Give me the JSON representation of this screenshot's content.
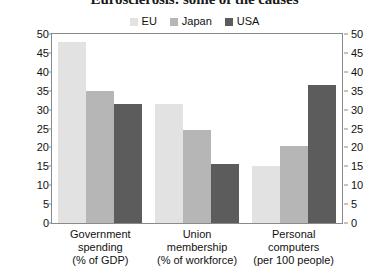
{
  "chart_data": {
    "type": "bar",
    "title": "Eurosclerosis: some of the causes",
    "xlabel": "",
    "ylabel": "",
    "ylim": [
      0,
      50
    ],
    "yticks": [
      0,
      5,
      10,
      15,
      20,
      25,
      30,
      35,
      40,
      45,
      50
    ],
    "grid": false,
    "legend_position": "top-center",
    "dual_y_axis": true,
    "categories": [
      "Government spending (% of GDP)",
      "Union membership (% of workforce)",
      "Personal computers (per 100 people)"
    ],
    "category_lines": [
      [
        "Government",
        "spending",
        "(% of GDP)"
      ],
      [
        "Union",
        "membership",
        "(% of workforce)"
      ],
      [
        "Personal",
        "computers",
        "(per 100 people)"
      ]
    ],
    "series": [
      {
        "name": "EU",
        "color": "#e2e2e2",
        "values": [
          48,
          31.5,
          15
        ]
      },
      {
        "name": "Japan",
        "color": "#b6b6b6",
        "values": [
          35,
          24.5,
          20.5
        ]
      },
      {
        "name": "USA",
        "color": "#5c5c5c",
        "values": [
          31.5,
          15.5,
          36.5
        ]
      }
    ]
  },
  "axis": {
    "left_tick_labels": [
      "50",
      "45",
      "40",
      "35",
      "30",
      "25",
      "20",
      "15",
      "10",
      "5",
      "0"
    ],
    "right_tick_labels": [
      "50",
      "45",
      "40",
      "35",
      "30",
      "25",
      "20",
      "15",
      "10",
      "5",
      "0"
    ]
  },
  "colors": {
    "eu": "#e2e2e2",
    "japan": "#b6b6b6",
    "usa": "#5c5c5c",
    "frame": "#8a8a8a",
    "text": "#111111"
  }
}
